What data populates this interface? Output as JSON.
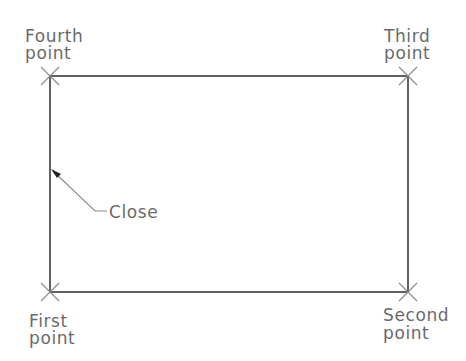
{
  "diagram": {
    "type": "rectangle-construction",
    "colors": {
      "outline": "#3a3a3a",
      "markers": "#8a8a8a",
      "labels": "#6a6a6a",
      "background": "#ffffff"
    },
    "points": [
      {
        "name": "first",
        "line1": "First",
        "line2": "point",
        "x": 50,
        "y": 292
      },
      {
        "name": "second",
        "line1": "Second",
        "line2": "point",
        "x": 408,
        "y": 292
      },
      {
        "name": "third",
        "line1": "Third",
        "line2": "point",
        "x": 408,
        "y": 76
      },
      {
        "name": "fourth",
        "line1": "Fourth",
        "line2": "point",
        "x": 50,
        "y": 76
      }
    ],
    "close_label": "Close"
  }
}
